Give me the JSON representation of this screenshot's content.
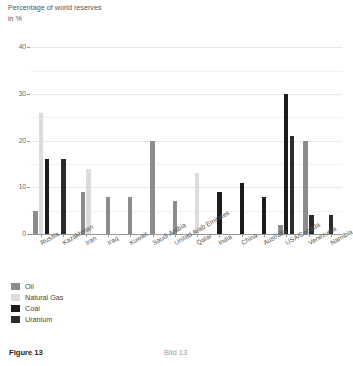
{
  "figure": {
    "caption_en": "Figure 13",
    "caption_de": "Bild 13"
  },
  "legend": {
    "position": "below-plot",
    "entries": [
      {
        "label": "Oil",
        "color": "#8c8c8c"
      },
      {
        "label": "Natural Gas",
        "color": "#dcdcdc"
      },
      {
        "label": "Coal",
        "color": "#1c1c1c"
      },
      {
        "label": "Uranium",
        "color": "#2b2b2b"
      }
    ]
  },
  "chart_data": {
    "type": "bar",
    "title": "",
    "ylabel": "Percentage of world reserves\nin %",
    "xlabel": "",
    "ylim": [
      0,
      42
    ],
    "yticks": [
      0,
      10,
      20,
      30,
      40
    ],
    "ytick_labels": [
      "0",
      "10",
      "20",
      "30",
      "40"
    ],
    "grid": true,
    "grid_axis": "y",
    "categories": [
      "Russia",
      "Kazakhstan",
      "Iran",
      "Iraq",
      "Kuwait",
      "Saudi Arabia",
      "United Arab Emirates",
      "Qatar",
      "India",
      "China",
      "Australia",
      "USA/Canada",
      "Venezuela",
      "Namibia"
    ],
    "series": [
      {
        "name": "Oil",
        "color": "#8c8c8c",
        "values": [
          5,
          0,
          9,
          8,
          8,
          20,
          7,
          0,
          0,
          0,
          0,
          2,
          20,
          0
        ]
      },
      {
        "name": "Natural Gas",
        "color": "#dcdcdc",
        "values": [
          26,
          0,
          14,
          0,
          0,
          0,
          0,
          13,
          0,
          0,
          0,
          0,
          0,
          0
        ]
      },
      {
        "name": "Coal",
        "color": "#1c1c1c",
        "values": [
          16,
          0,
          0,
          0,
          0,
          0,
          0,
          0,
          9,
          11,
          8,
          30,
          0,
          0
        ]
      },
      {
        "name": "Uranium",
        "color": "#2b2b2b",
        "values": [
          0,
          16,
          0,
          0,
          0,
          0,
          0,
          0,
          0,
          0,
          0,
          21,
          4,
          4
        ]
      }
    ],
    "bars": [
      {
        "category": "Russia",
        "series": "Oil",
        "value": 5
      },
      {
        "category": "Russia",
        "series": "Natural Gas",
        "value": 26
      },
      {
        "category": "Russia",
        "series": "Coal",
        "value": 16
      },
      {
        "category": "Kazakhstan",
        "series": "Uranium",
        "value": 16
      },
      {
        "category": "Iran",
        "series": "Oil",
        "value": 9
      },
      {
        "category": "Iran",
        "series": "Natural Gas",
        "value": 14
      },
      {
        "category": "Iraq",
        "series": "Oil",
        "value": 8
      },
      {
        "category": "Kuwait",
        "series": "Oil",
        "value": 8
      },
      {
        "category": "Saudi Arabia",
        "series": "Oil",
        "value": 20
      },
      {
        "category": "United Arab Emirates",
        "series": "Oil",
        "value": 7
      },
      {
        "category": "Qatar",
        "series": "Natural Gas",
        "value": 13
      },
      {
        "category": "India",
        "series": "Coal",
        "value": 9
      },
      {
        "category": "China",
        "series": "Coal",
        "value": 11
      },
      {
        "category": "Australia",
        "series": "Coal",
        "value": 8
      },
      {
        "category": "USA/Canada",
        "series": "Oil",
        "value": 2
      },
      {
        "category": "USA/Canada",
        "series": "Coal",
        "value": 30
      },
      {
        "category": "USA/Canada",
        "series": "Uranium",
        "value": 21
      },
      {
        "category": "Venezuela",
        "series": "Oil",
        "value": 20
      },
      {
        "category": "Venezuela",
        "series": "Natural Gas",
        "value": 12
      },
      {
        "category": "Venezuela",
        "series": "Uranium",
        "value": 4
      },
      {
        "category": "Namibia",
        "series": "Uranium",
        "value": 4
      }
    ]
  }
}
